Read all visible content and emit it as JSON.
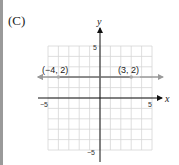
{
  "choice_label": "(C)",
  "chart_data": {
    "type": "line",
    "title": "",
    "xlabel": "x",
    "ylabel": "y",
    "xlim": [
      -5,
      5
    ],
    "ylim": [
      -5,
      5
    ],
    "grid": true,
    "x_ticks": [
      "-5",
      "5"
    ],
    "y_ticks": [
      "5",
      "-5"
    ],
    "series": [
      {
        "name": "y = 2",
        "type": "line",
        "y": 2,
        "arrows": "both",
        "color": "#9a9a9a"
      },
      {
        "name": "segment",
        "x": [
          -4,
          3
        ],
        "y": [
          2,
          2
        ],
        "color": "#555555"
      }
    ],
    "points": [
      {
        "x": -4,
        "y": 2,
        "label": "(−4, 2)"
      },
      {
        "x": 3,
        "y": 2,
        "label": "(3, 2)"
      }
    ]
  },
  "labels": {
    "x_axis": "x",
    "y_axis": "y",
    "x_min": "−5",
    "x_max": "5",
    "y_max": "5",
    "y_min": "−5",
    "point_a": "(−4, 2)",
    "point_b": "(3, 2)"
  }
}
